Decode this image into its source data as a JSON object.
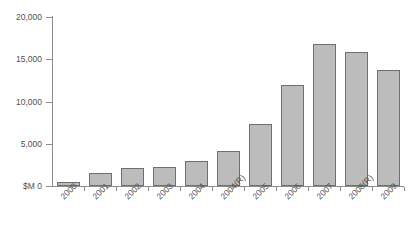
{
  "chart_data": {
    "type": "bar",
    "title": "",
    "xlabel": "",
    "ylabel": "$M",
    "categories": [
      "2000",
      "2001",
      "2002",
      "2003",
      "2004",
      "2004(R)",
      "2005",
      "2006",
      "2007",
      "2008(R)",
      "2009"
    ],
    "values": [
      500,
      1500,
      2100,
      2200,
      2900,
      4200,
      7300,
      12000,
      16800,
      15800,
      13700
    ],
    "ylim": [
      0,
      20000
    ],
    "ytick_values": [
      0,
      5000,
      10000,
      15000,
      20000
    ],
    "ytick_labels": [
      "$M 0",
      "5,000",
      "10,000",
      "15,000",
      "20,000"
    ],
    "grid": false,
    "legend": "none",
    "bar_fill_color": "#bcbcbc",
    "bar_border_color": "#6f6f6f",
    "axis_color": "#8d8d8d",
    "background_color": "#ffffff"
  }
}
